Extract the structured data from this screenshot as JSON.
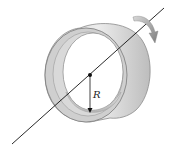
{
  "diagram": {
    "labels": {
      "radius": "R"
    },
    "colors": {
      "ring_light": "#e4e4e4",
      "ring_mid": "#c8c8c8",
      "ring_dark": "#a9a9a9",
      "outline": "#7a7a7a",
      "axis": "#111111",
      "arrow": "#8c8c8c"
    },
    "elements": [
      "rotation-axis",
      "hollow-cylinder",
      "center-point",
      "radius-arrow",
      "rotation-arrow"
    ]
  }
}
